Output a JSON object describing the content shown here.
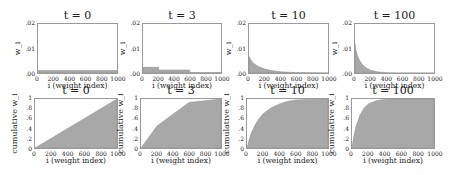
{
  "figure": {
    "fill_color": "#a8a8a8",
    "frame_color": "#9a9a9a"
  },
  "chart_data": [
    {
      "type": "area",
      "title": "t = 0",
      "xlabel": "i (weight index)",
      "ylabel": "w_i",
      "xticks": [
        "0",
        "200",
        "400",
        "600",
        "800",
        "1000"
      ],
      "yticks": [
        ".00",
        ".01",
        ".02"
      ],
      "xlim": [
        0,
        1000
      ],
      "ylim": [
        0,
        0.02
      ],
      "x": [
        0,
        1000
      ],
      "values": [
        0.001,
        0.001
      ]
    },
    {
      "type": "area",
      "title": "t = 3",
      "xlabel": "i (weight index)",
      "ylabel": "w_i",
      "xticks": [
        "0",
        "200",
        "400",
        "600",
        "800",
        "1000"
      ],
      "yticks": [
        ".00",
        ".01",
        ".02"
      ],
      "xlim": [
        0,
        1000
      ],
      "ylim": [
        0,
        0.02
      ],
      "x": [
        0,
        200,
        200,
        600,
        600,
        1000
      ],
      "values": [
        0.0023,
        0.0023,
        0.0012,
        0.0012,
        0.0002,
        0.0002
      ]
    },
    {
      "type": "area",
      "title": "t = 10",
      "xlabel": "i (weight index)",
      "ylabel": "w_i",
      "xticks": [
        "0",
        "200",
        "400",
        "600",
        "800",
        "1000"
      ],
      "yticks": [
        ".00",
        ".01",
        ".02"
      ],
      "xlim": [
        0,
        1000
      ],
      "ylim": [
        0,
        0.02
      ],
      "x": [
        0,
        20,
        50,
        100,
        150,
        200,
        300,
        400,
        500,
        600,
        800,
        1000
      ],
      "values": [
        0.0068,
        0.0055,
        0.0042,
        0.003,
        0.0022,
        0.0016,
        0.0009,
        0.0005,
        0.0003,
        0.0002,
        0.0001,
        5e-05
      ]
    },
    {
      "type": "area",
      "title": "t = 100",
      "xlabel": "i (weight index)",
      "ylabel": "w_i",
      "xticks": [
        "0",
        "200",
        "400",
        "600",
        "800",
        "1000"
      ],
      "yticks": [
        ".00",
        ".01",
        ".02"
      ],
      "xlim": [
        0,
        1000
      ],
      "ylim": [
        0,
        0.02
      ],
      "x": [
        0,
        10,
        30,
        60,
        100,
        150,
        200,
        300,
        400,
        500,
        1000
      ],
      "values": [
        0.012,
        0.0095,
        0.0072,
        0.005,
        0.0032,
        0.0019,
        0.0011,
        0.0004,
        0.00015,
        5e-05,
        0.0
      ]
    },
    {
      "type": "area",
      "title": "t = 0",
      "xlabel": "i (weight index)",
      "ylabel": "cumulative w_i",
      "xticks": [
        "0",
        "200",
        "400",
        "600",
        "800",
        "1000"
      ],
      "yticks": [
        "0",
        ".2",
        ".4",
        ".6",
        ".8",
        "1"
      ],
      "xlim": [
        0,
        1000
      ],
      "ylim": [
        0,
        1
      ],
      "x": [
        0,
        1000
      ],
      "values": [
        0,
        1.0
      ]
    },
    {
      "type": "area",
      "title": "t = 3",
      "xlabel": "i (weight index)",
      "ylabel": "cumulative w_i",
      "xticks": [
        "0",
        "200",
        "400",
        "600",
        "800",
        "1000"
      ],
      "yticks": [
        "0",
        ".2",
        ".4",
        ".6",
        ".8",
        "1"
      ],
      "xlim": [
        0,
        1000
      ],
      "ylim": [
        0,
        1
      ],
      "x": [
        0,
        200,
        600,
        1000
      ],
      "values": [
        0,
        0.45,
        0.93,
        1.0
      ]
    },
    {
      "type": "area",
      "title": "t = 10",
      "xlabel": "i (weight index)",
      "ylabel": "cumulative w_i",
      "xticks": [
        "0",
        "200",
        "400",
        "600",
        "800",
        "1000"
      ],
      "yticks": [
        "0",
        ".2",
        ".4",
        ".6",
        ".8",
        "1"
      ],
      "xlim": [
        0,
        1000
      ],
      "ylim": [
        0,
        1
      ],
      "x": [
        0,
        25,
        50,
        100,
        150,
        200,
        300,
        400,
        500,
        600,
        800,
        1000
      ],
      "values": [
        0,
        0.16,
        0.29,
        0.47,
        0.6,
        0.7,
        0.82,
        0.9,
        0.95,
        0.98,
        0.995,
        1.0
      ]
    },
    {
      "type": "area",
      "title": "t = 100",
      "xlabel": "i (weight index)",
      "ylabel": "cumulative w_i",
      "xticks": [
        "0",
        "200",
        "400",
        "600",
        "800",
        "1000"
      ],
      "yticks": [
        "0",
        ".2",
        ".4",
        ".6",
        ".8",
        "1"
      ],
      "xlim": [
        0,
        1000
      ],
      "ylim": [
        0,
        1
      ],
      "x": [
        0,
        10,
        25,
        50,
        100,
        150,
        200,
        300,
        400,
        500,
        1000
      ],
      "values": [
        0,
        0.11,
        0.26,
        0.45,
        0.68,
        0.82,
        0.9,
        0.97,
        0.99,
        1.0,
        1.0
      ]
    }
  ]
}
